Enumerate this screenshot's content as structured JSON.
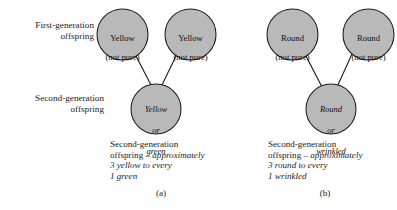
{
  "figure": {
    "background_color": "#ffffff",
    "circle_fill_color": "#b9b9b9",
    "circle_stroke_color": "#1a1a1a",
    "row_labels": {
      "first_generation": "First-generation\noffspring",
      "second_generation": "Second-generation\noffspring"
    }
  },
  "panels": [
    {
      "id": "a",
      "letter": "(a)",
      "parents": [
        {
          "line1": "Yellow",
          "line2": "(not pure)"
        },
        {
          "line1": "Yellow",
          "line2": "(not pure)"
        }
      ],
      "offspring": {
        "line1": "Yellow",
        "line2": "or",
        "line3": "green"
      },
      "caption": {
        "line1": "Second-generation",
        "line2_roman": "offspring – ",
        "line2_italic": "approximately",
        "line3": "3 yellow to every",
        "line4": "1 green"
      }
    },
    {
      "id": "b",
      "letter": "(b)",
      "parents": [
        {
          "line1": "Round",
          "line2": "(not pure)"
        },
        {
          "line1": "Round",
          "line2": "(not pure)"
        }
      ],
      "offspring": {
        "line1": "Round",
        "line2": "or",
        "line3": "wrinkled"
      },
      "caption": {
        "line1": "Second-generation",
        "line2_roman": "offspring – ",
        "line2_italic": "approximately",
        "line3": "3 round to every",
        "line4": "1 wrinkled"
      }
    }
  ]
}
